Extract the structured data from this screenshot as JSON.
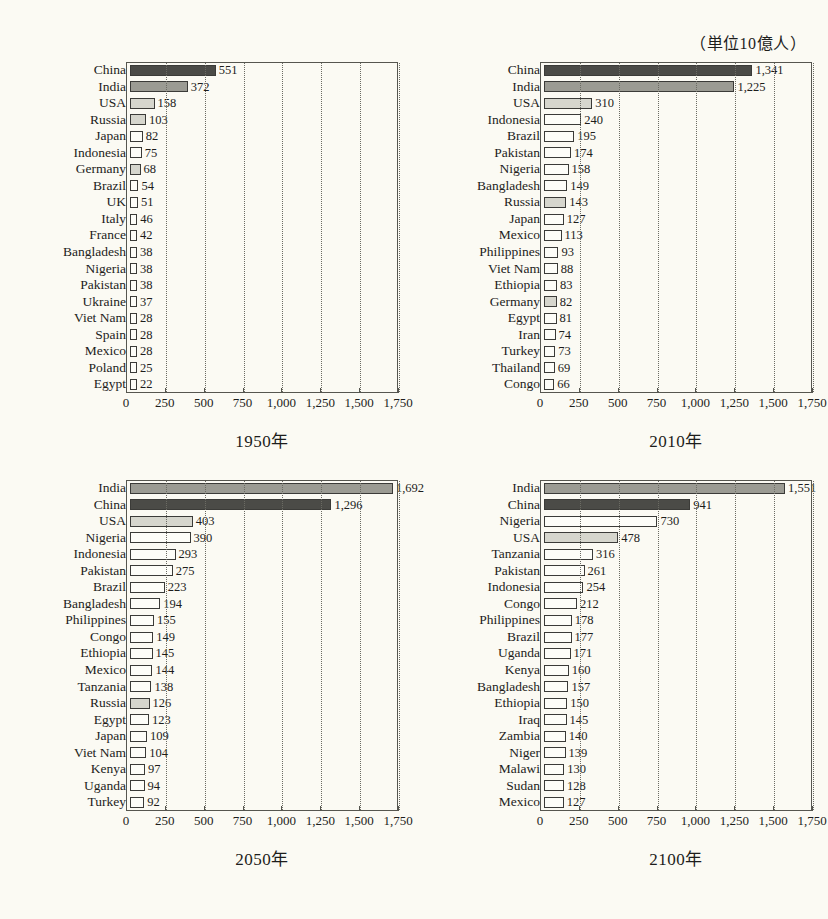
{
  "header": {
    "clipped_top_text": "・・・・・・・・・・・・・",
    "unit_note": "（単位10億人）"
  },
  "axis": {
    "ticks": [
      "0",
      "250",
      "500",
      "750",
      "1,000",
      "1,250",
      "1,500",
      "1,750"
    ],
    "tick_values": [
      0,
      250,
      500,
      750,
      1000,
      1250,
      1500,
      1750
    ],
    "min": 0,
    "max": 1750
  },
  "colors": {
    "dark": "#4b4b47",
    "mid": "#9b9b93",
    "light": "#d6d6cd",
    "white": "#fdfdf8",
    "outline": "#3b3b38",
    "frame": "#56564f",
    "grid": "#6b6b63",
    "background": "#fbfaf3"
  },
  "chart_data": [
    {
      "type": "bar",
      "orientation": "horizontal",
      "title": "1950年",
      "xlabel": "",
      "ylabel": "",
      "xlim": [
        0,
        1750
      ],
      "grid": true,
      "legend": "none",
      "categories": [
        "China",
        "India",
        "USA",
        "Russia",
        "Japan",
        "Indonesia",
        "Germany",
        "Brazil",
        "UK",
        "Italy",
        "France",
        "Bangladesh",
        "Nigeria",
        "Pakistan",
        "Ukraine",
        "Viet Nam",
        "Spain",
        "Mexico",
        "Poland",
        "Egypt"
      ],
      "values": [
        551,
        372,
        158,
        103,
        82,
        75,
        68,
        54,
        51,
        46,
        42,
        38,
        38,
        38,
        37,
        28,
        28,
        28,
        25,
        22
      ],
      "labels": [
        "551",
        "372",
        "158",
        "103",
        "82",
        "75",
        "68",
        "54",
        "51",
        "46",
        "42",
        "38",
        "38",
        "38",
        "37",
        "28",
        "28",
        "28",
        "25",
        "22"
      ],
      "shades": [
        "dark",
        "mid",
        "light",
        "light",
        "white",
        "white",
        "light",
        "white",
        "white",
        "white",
        "white",
        "white",
        "white",
        "white",
        "white",
        "white",
        "white",
        "white",
        "white",
        "white"
      ]
    },
    {
      "type": "bar",
      "orientation": "horizontal",
      "title": "2010年",
      "xlabel": "",
      "ylabel": "",
      "xlim": [
        0,
        1750
      ],
      "grid": true,
      "legend": "none",
      "categories": [
        "China",
        "India",
        "USA",
        "Indonesia",
        "Brazil",
        "Pakistan",
        "Nigeria",
        "Bangladesh",
        "Russia",
        "Japan",
        "Mexico",
        "Philippines",
        "Viet Nam",
        "Ethiopia",
        "Germany",
        "Egypt",
        "Iran",
        "Turkey",
        "Thailand",
        "Congo"
      ],
      "values": [
        1341,
        1225,
        310,
        240,
        195,
        174,
        158,
        149,
        143,
        127,
        113,
        93,
        88,
        83,
        82,
        81,
        74,
        73,
        69,
        66
      ],
      "labels": [
        "1,341",
        "1,225",
        "310",
        "240",
        "195",
        "174",
        "158",
        "149",
        "143",
        "127",
        "113",
        "93",
        "88",
        "83",
        "82",
        "81",
        "74",
        "73",
        "69",
        "66"
      ],
      "shades": [
        "dark",
        "mid",
        "light",
        "white",
        "white",
        "white",
        "white",
        "white",
        "light",
        "white",
        "white",
        "white",
        "white",
        "white",
        "light",
        "white",
        "white",
        "white",
        "white",
        "white"
      ]
    },
    {
      "type": "bar",
      "orientation": "horizontal",
      "title": "2050年",
      "xlabel": "",
      "ylabel": "",
      "xlim": [
        0,
        1750
      ],
      "grid": true,
      "legend": "none",
      "categories": [
        "India",
        "China",
        "USA",
        "Nigeria",
        "Indonesia",
        "Pakistan",
        "Brazil",
        "Bangladesh",
        "Philippines",
        "Congo",
        "Ethiopia",
        "Mexico",
        "Tanzania",
        "Russia",
        "Egypt",
        "Japan",
        "Viet Nam",
        "Kenya",
        "Uganda",
        "Turkey"
      ],
      "values": [
        1692,
        1296,
        403,
        390,
        293,
        275,
        223,
        194,
        155,
        149,
        145,
        144,
        138,
        126,
        123,
        109,
        104,
        97,
        94,
        92
      ],
      "labels": [
        "1,692",
        "1,296",
        "403",
        "390",
        "293",
        "275",
        "223",
        "194",
        "155",
        "149",
        "145",
        "144",
        "138",
        "126",
        "123",
        "109",
        "104",
        "97",
        "94",
        "92"
      ],
      "shades": [
        "mid",
        "dark",
        "light",
        "white",
        "white",
        "white",
        "white",
        "white",
        "white",
        "white",
        "white",
        "white",
        "white",
        "light",
        "white",
        "white",
        "white",
        "white",
        "white",
        "white"
      ]
    },
    {
      "type": "bar",
      "orientation": "horizontal",
      "title": "2100年",
      "xlabel": "",
      "ylabel": "",
      "xlim": [
        0,
        1750
      ],
      "grid": true,
      "legend": "none",
      "categories": [
        "India",
        "China",
        "Nigeria",
        "USA",
        "Tanzania",
        "Pakistan",
        "Indonesia",
        "Congo",
        "Philippines",
        "Brazil",
        "Uganda",
        "Kenya",
        "Bangladesh",
        "Ethiopia",
        "Iraq",
        "Zambia",
        "Niger",
        "Malawi",
        "Sudan",
        "Mexico"
      ],
      "values": [
        1551,
        941,
        730,
        478,
        316,
        261,
        254,
        212,
        178,
        177,
        171,
        160,
        157,
        150,
        145,
        140,
        139,
        130,
        128,
        127
      ],
      "labels": [
        "1,551",
        "941",
        "730",
        "478",
        "316",
        "261",
        "254",
        "212",
        "178",
        "177",
        "171",
        "160",
        "157",
        "150",
        "145",
        "140",
        "139",
        "130",
        "128",
        "127"
      ],
      "shades": [
        "mid",
        "dark",
        "white",
        "light",
        "white",
        "white",
        "white",
        "white",
        "white",
        "white",
        "white",
        "white",
        "white",
        "white",
        "white",
        "white",
        "white",
        "white",
        "white",
        "white"
      ]
    }
  ]
}
